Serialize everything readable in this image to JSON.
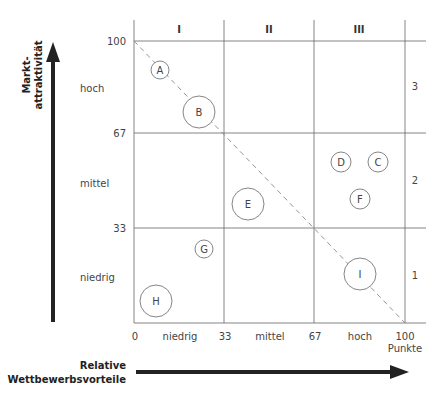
{
  "diagram": {
    "type": "portfolio-matrix",
    "y_axis": {
      "title_line1": "Markt-",
      "title_line2": "attraktivität"
    },
    "x_axis": {
      "title_line1": "Relative",
      "title_line2": "Wettbewerbsvorteile"
    },
    "column_headers": [
      "I",
      "II",
      "III"
    ],
    "row_numbers": [
      "3",
      "2",
      "1"
    ],
    "y_ticks": [
      "100",
      "67",
      "33"
    ],
    "y_levels": [
      "hoch",
      "mittel",
      "niedrig"
    ],
    "x_ticks": [
      "0",
      "33",
      "67",
      "100"
    ],
    "x_levels": [
      "niedrig",
      "mittel",
      "hoch"
    ],
    "x_unit": "Punkte",
    "bubbles": [
      {
        "label": "A",
        "x": 10,
        "y": 89,
        "size": "small"
      },
      {
        "label": "B",
        "x": 24,
        "y": 76,
        "size": "large"
      },
      {
        "label": "C",
        "x": 90,
        "y": 57,
        "size": "small"
      },
      {
        "label": "D",
        "x": 76,
        "y": 57,
        "size": "small"
      },
      {
        "label": "E",
        "x": 42,
        "y": 43,
        "size": "large"
      },
      {
        "label": "F",
        "x": 83,
        "y": 44,
        "size": "small"
      },
      {
        "label": "G",
        "x": 26,
        "y": 27,
        "size": "small"
      },
      {
        "label": "H",
        "x": 8,
        "y": 8,
        "size": "large"
      },
      {
        "label": "I",
        "x": 83,
        "y": 17,
        "size": "large"
      }
    ]
  }
}
